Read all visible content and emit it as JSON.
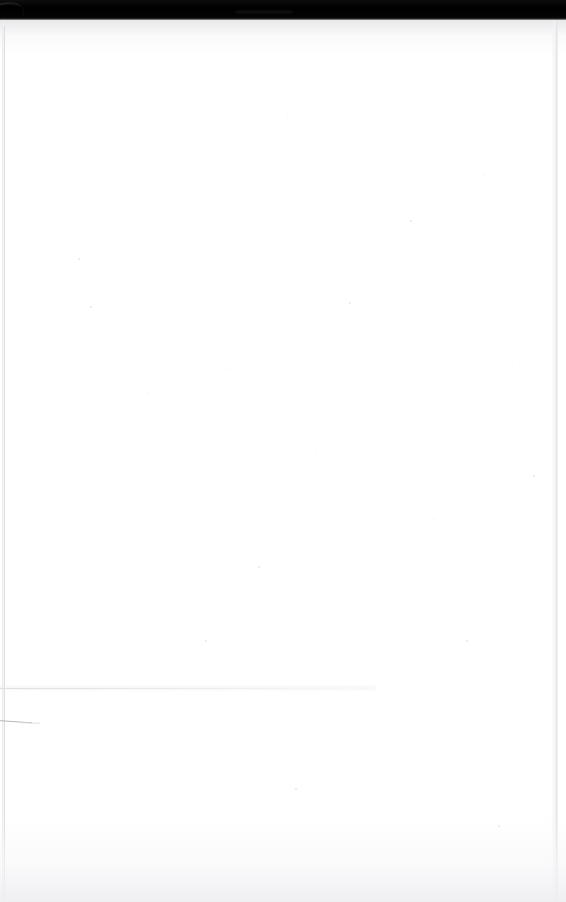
{
  "document": {
    "kind": "scanned-page-image",
    "page_state": "blank",
    "body_text": "",
    "visible_text_count": 0
  },
  "scan_bar": {
    "name": "scanner-shadow-bar",
    "position": "top",
    "height_px": 20,
    "color": "#050505",
    "streak_label": "",
    "corner_mark_label": ""
  },
  "page": {
    "background_color": "#ffffff",
    "width_px": 566,
    "height_px": 902
  },
  "artifacts": {
    "left_edge_label": "",
    "right_edge_label": "",
    "crease_line_label": "",
    "diagonal_stroke_label": "",
    "top_wash_label": "",
    "bottom_wash_label": ""
  },
  "specks": [
    {
      "x": 78,
      "y": 238,
      "d": 2
    },
    {
      "x": 90,
      "y": 286,
      "d": 2
    },
    {
      "x": 148,
      "y": 372,
      "d": 1
    },
    {
      "x": 205,
      "y": 620,
      "d": 2
    },
    {
      "x": 229,
      "y": 348,
      "d": 1
    },
    {
      "x": 258,
      "y": 546,
      "d": 2
    },
    {
      "x": 287,
      "y": 97,
      "d": 1
    },
    {
      "x": 295,
      "y": 768,
      "d": 2
    },
    {
      "x": 316,
      "y": 430,
      "d": 1
    },
    {
      "x": 349,
      "y": 282,
      "d": 2
    },
    {
      "x": 362,
      "y": 668,
      "d": 1
    },
    {
      "x": 410,
      "y": 200,
      "d": 2
    },
    {
      "x": 433,
      "y": 499,
      "d": 1
    },
    {
      "x": 466,
      "y": 620,
      "d": 2
    },
    {
      "x": 484,
      "y": 155,
      "d": 1
    },
    {
      "x": 498,
      "y": 805,
      "d": 2
    },
    {
      "x": 512,
      "y": 345,
      "d": 1
    },
    {
      "x": 533,
      "y": 455,
      "d": 2
    }
  ]
}
